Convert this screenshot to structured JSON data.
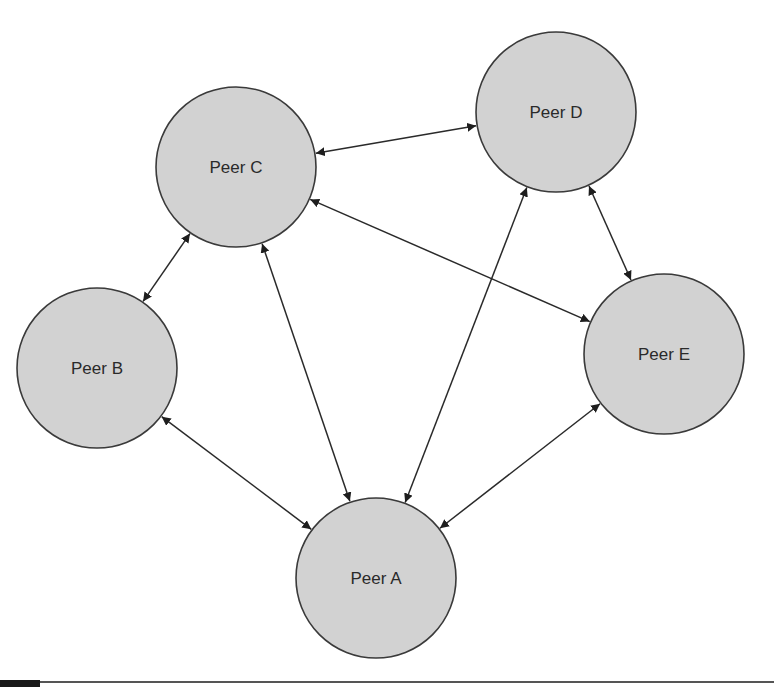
{
  "diagram": {
    "type": "peer-to-peer network",
    "nodes": [
      {
        "id": "A",
        "label": "Peer A",
        "cx": 376,
        "cy": 578,
        "r": 80
      },
      {
        "id": "B",
        "label": "Peer B",
        "cx": 97,
        "cy": 368,
        "r": 80
      },
      {
        "id": "C",
        "label": "Peer C",
        "cx": 236,
        "cy": 167,
        "r": 80
      },
      {
        "id": "D",
        "label": "Peer D",
        "cx": 556,
        "cy": 112,
        "r": 80
      },
      {
        "id": "E",
        "label": "Peer E",
        "cx": 664,
        "cy": 354,
        "r": 80
      }
    ],
    "edges": [
      {
        "from": "C",
        "to": "D",
        "bidirectional": true
      },
      {
        "from": "C",
        "to": "B",
        "bidirectional": true
      },
      {
        "from": "C",
        "to": "A",
        "bidirectional": true
      },
      {
        "from": "C",
        "to": "E",
        "bidirectional": true
      },
      {
        "from": "D",
        "to": "A",
        "bidirectional": true
      },
      {
        "from": "D",
        "to": "E",
        "bidirectional": true
      },
      {
        "from": "B",
        "to": "A",
        "bidirectional": true
      },
      {
        "from": "E",
        "to": "A",
        "bidirectional": true
      }
    ],
    "colors": {
      "node_fill": "#d2d2d2",
      "node_stroke": "#3a3a3a",
      "edge": "#2a2a2a"
    }
  }
}
